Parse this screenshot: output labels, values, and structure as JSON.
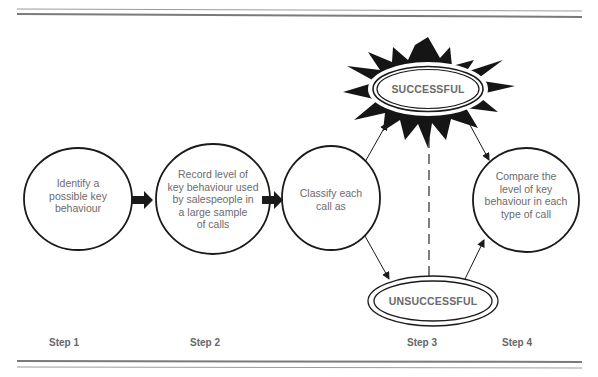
{
  "diagram": {
    "type": "process-flow",
    "steps": [
      {
        "label": "Step 1",
        "text": "Identify a possible key behaviour"
      },
      {
        "label": "Step 2",
        "text": "Record level of key behaviour used by salespeople in a large sample of calls"
      },
      {
        "label": "Step 3",
        "text": "Classify each call as"
      },
      {
        "label": "Step 4",
        "text": "Compare the level of key behaviour in each type of call"
      }
    ],
    "step_lines": {
      "s1": [
        "Identify a",
        "possible key",
        "behaviour"
      ],
      "s2": [
        "Record level of",
        "key behaviour used",
        "by salespeople in",
        "a large sample",
        "of calls"
      ],
      "s3": [
        "Classify each",
        "call as"
      ],
      "s4": [
        "Compare the",
        "level of key",
        "behaviour in each",
        "type of call"
      ]
    },
    "outcomes": {
      "successful": "SUCCESSFUL",
      "unsuccessful": "UNSUCCESSFUL"
    },
    "step_labels": {
      "step1": "Step 1",
      "step2": "Step 2",
      "step3": "Step 3",
      "step4": "Step 4"
    },
    "colors": {
      "ink": "#1a1a1a",
      "text": "#6b6b6b",
      "rule": "#8a8a8a"
    }
  }
}
